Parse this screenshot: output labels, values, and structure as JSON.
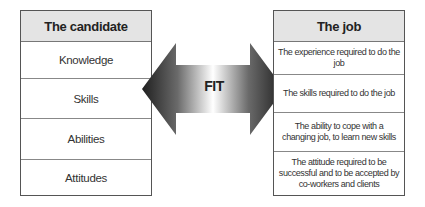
{
  "candidate": {
    "title": "The candidate",
    "items": [
      "Knowledge",
      "Skills",
      "Abilities",
      "Attitudes"
    ]
  },
  "job": {
    "title": "The job",
    "items": [
      "The experience required to do the job",
      "The skills required to do the job",
      "The ability to cope with a changing job, to learn new skills",
      "The attitude required to be successful and to be accepted by co-workers and clients"
    ]
  },
  "arrow": {
    "label": "FIT",
    "icon": "double-headed-arrow-icon",
    "colors": {
      "dark": "#2a2a2a",
      "light": "#ffffff"
    }
  }
}
